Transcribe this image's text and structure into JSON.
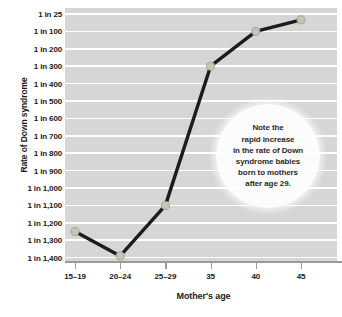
{
  "chart_data": {
    "type": "line",
    "title": "",
    "xlabel": "Mother's age",
    "ylabel": "Rate of Down syndrome",
    "grid": true,
    "legend": "none",
    "categories": [
      "15–19",
      "20–24",
      "25–29",
      "35",
      "40",
      "45"
    ],
    "y_tick_labels": [
      "1 in 25",
      "1 in 100",
      "1 in 200",
      "1 in 300",
      "1 in 400",
      "1 in 500",
      "1 in 600",
      "1 in 700",
      "1 in 800",
      "1 in 900",
      "1 in 1,000",
      "1 in 1,100",
      "1 in 1,200",
      "1 in 1,300",
      "1 in 1,400"
    ],
    "y_tick_values": [
      25,
      100,
      200,
      300,
      400,
      500,
      600,
      700,
      800,
      900,
      1000,
      1100,
      1200,
      1300,
      1400
    ],
    "values": [
      1250,
      1390,
      1100,
      300,
      100,
      50
    ],
    "value_labels": [
      "1 in 1,250",
      "1 in 1,400",
      "1 in 1,100",
      "1 in 300",
      "1 in 100",
      "1 in 50"
    ],
    "series": [
      {
        "name": "Rate of Down syndrome",
        "values": [
          1250,
          1390,
          1100,
          300,
          100,
          50
        ]
      }
    ],
    "annotations": [
      {
        "name": "note-bubble",
        "lines": [
          "Note the",
          "rapid increase",
          "in the rate of Down",
          "syndrome babies",
          "born to mothers",
          "after age 29."
        ]
      }
    ],
    "colors": {
      "plot_background": "#d6d6d6",
      "gridline": "#ffffff",
      "line": "#1c1c1c",
      "marker_fill": "#c8c3b4",
      "marker_edge": "#9e9a8d",
      "axis": "#9a9a9a",
      "text": "#1a1a1a",
      "bubble_background": "#ffffff"
    }
  }
}
